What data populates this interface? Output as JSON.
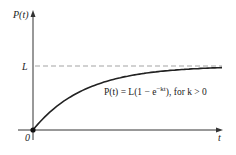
{
  "chart_data": {
    "type": "line",
    "title": "",
    "ylabel": "P(t)",
    "xlabel": "t",
    "origin_label": "0",
    "asymptote_label": "L",
    "annotation": "P(t) = L(1 − e^(−kt)), for k > 0",
    "series": [
      {
        "name": "P(t) = L(1 − e^(−kt))",
        "function": "L*(1-exp(-k*t))",
        "x": [
          0,
          0.25,
          0.5,
          1,
          1.5,
          2,
          3,
          4,
          5
        ],
        "values": [
          0,
          0.22,
          0.39,
          0.63,
          0.78,
          0.86,
          0.95,
          0.98,
          0.99
        ]
      }
    ],
    "asymptote": {
      "y": 1,
      "label": "L",
      "style": "dashed"
    },
    "grid": false,
    "legend": "none"
  },
  "labels": {
    "y_axis": "P(t)",
    "x_axis": "t",
    "origin": "0",
    "asymptote": "L",
    "formula_prefix": "P(t) = L(1 − e",
    "formula_exp": "−kt",
    "formula_suffix": "), for k > 0"
  },
  "colors": {
    "axis": "#333333",
    "curve": "#222222",
    "dashed": "#888888"
  }
}
